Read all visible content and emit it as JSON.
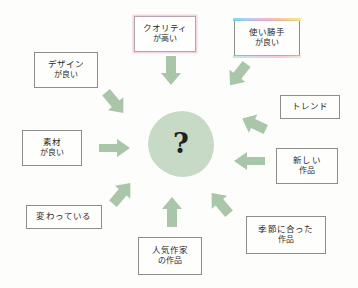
{
  "diagram": {
    "center": {
      "symbol": "?",
      "name": "central-question-blob",
      "color": "#c6dac6"
    },
    "arrow_color": "#a9c6a9",
    "nodes": [
      {
        "id": "quality",
        "name": "node-quality",
        "line1": "クオリティ",
        "line2": "が高い",
        "highlight": "pink"
      },
      {
        "id": "usability",
        "name": "node-usability",
        "line1": "使い勝手",
        "line2": "が良い",
        "highlight": "rainbow"
      },
      {
        "id": "design",
        "name": "node-design",
        "line1": "デザイン",
        "line2": "が良い",
        "highlight": "none"
      },
      {
        "id": "trend",
        "name": "node-trend",
        "line1": "トレンド",
        "line2": "",
        "highlight": "none"
      },
      {
        "id": "material",
        "name": "node-material",
        "line1": "素材",
        "line2": "が良い",
        "highlight": "none"
      },
      {
        "id": "new-work",
        "name": "node-new-work",
        "line1": "新しい",
        "line2": "作品",
        "highlight": "none"
      },
      {
        "id": "unusual",
        "name": "node-unusual",
        "line1": "変わっている",
        "line2": "",
        "highlight": "none"
      },
      {
        "id": "seasonal",
        "name": "node-seasonal",
        "line1": "季節に合った",
        "line2": "作品",
        "highlight": "none"
      },
      {
        "id": "popular-artist",
        "name": "node-popular-artist",
        "line1": "人気作家",
        "line2": "の作品",
        "highlight": "none"
      }
    ],
    "arrows": [
      {
        "id": "arrow-quality",
        "name": "arrow-from-quality",
        "direction": "down"
      },
      {
        "id": "arrow-usability",
        "name": "arrow-from-usability",
        "direction": "down-left"
      },
      {
        "id": "arrow-design",
        "name": "arrow-from-design",
        "direction": "down-right"
      },
      {
        "id": "arrow-trend",
        "name": "arrow-from-trend",
        "direction": "left-down"
      },
      {
        "id": "arrow-material",
        "name": "arrow-from-material",
        "direction": "right"
      },
      {
        "id": "arrow-new-work",
        "name": "arrow-from-new-work",
        "direction": "left"
      },
      {
        "id": "arrow-unusual",
        "name": "arrow-from-unusual",
        "direction": "up-right"
      },
      {
        "id": "arrow-popular-artist",
        "name": "arrow-from-popular-artist",
        "direction": "up"
      },
      {
        "id": "arrow-seasonal",
        "name": "arrow-from-seasonal",
        "direction": "up-left"
      }
    ]
  }
}
